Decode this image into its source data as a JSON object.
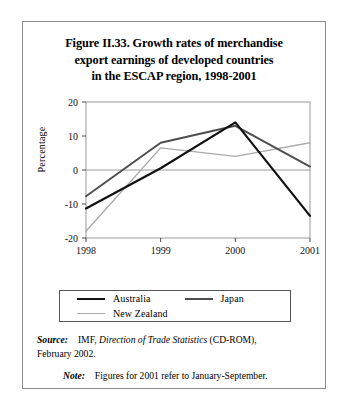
{
  "figure": {
    "title_lines": [
      "Figure II.33.  Growth rates of merchandise",
      "export earnings of developed countries",
      "in the ESCAP region, 1998-2001"
    ]
  },
  "legend": {
    "entries": [
      {
        "label": "Australia",
        "color": "#111111"
      },
      {
        "label": "Japan",
        "color": "#4d4d4d"
      },
      {
        "label": "New Zealand",
        "color": "#aaaaaa"
      }
    ]
  },
  "notes": {
    "source_lead": "Source:",
    "source_pre": "IMF,",
    "source_italic": "Direction of Trade Statistics",
    "source_post": "(CD-ROM),",
    "source_line2": "February 2002.",
    "note_lead": "Note:",
    "note_text": "Figures for 2001 refer to January-September."
  },
  "chart_data": {
    "type": "line",
    "title": "Growth rates of merchandise export earnings of developed countries in the ESCAP region, 1998-2001",
    "xlabel": "",
    "ylabel": "Percentage",
    "categories": [
      "1998",
      "1999",
      "2000",
      "2001"
    ],
    "x_tick_labels": [
      "1998",
      "1999",
      "2000",
      "2001"
    ],
    "y_tick_labels": [
      "20",
      "10",
      "0",
      "-10",
      "-20"
    ],
    "y_ticks": [
      20,
      10,
      0,
      -10,
      -20
    ],
    "ylim": [
      -20,
      20
    ],
    "grid": false,
    "zero_line": true,
    "legend_position": "below",
    "series": [
      {
        "name": "Australia",
        "color": "#111111",
        "values": [
          -11.3,
          0.5,
          14.0,
          -13.5
        ]
      },
      {
        "name": "Japan",
        "color": "#4d4d4d",
        "values": [
          -7.7,
          8.0,
          13.0,
          1.0
        ]
      },
      {
        "name": "New Zealand",
        "color": "#aaaaaa",
        "values": [
          -18.0,
          6.5,
          4.0,
          8.0
        ]
      }
    ]
  }
}
